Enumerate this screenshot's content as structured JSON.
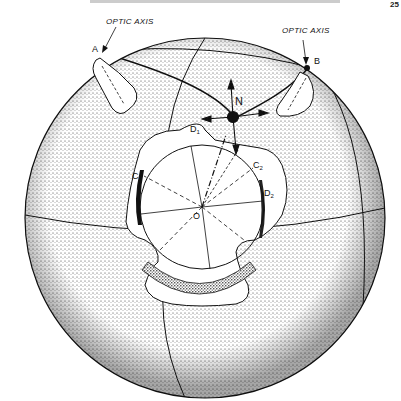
{
  "header": {
    "running_head": "",
    "page_number": "25"
  },
  "figure": {
    "labels": {
      "optic_axis_left": "OPTIC AXIS",
      "optic_axis_right": "OPTIC AXIS",
      "point_a": "A",
      "point_b": "B",
      "normal": "N",
      "d1": "D",
      "d1_sub": "1",
      "d2": "D",
      "d2_sub": "2",
      "c1": "C",
      "c1_sub": "1",
      "c2": "C",
      "c2_sub": "2",
      "origin": "O"
    },
    "colors": {
      "ink": "#111111",
      "stipple": "#333333",
      "paper": "#ffffff"
    }
  }
}
